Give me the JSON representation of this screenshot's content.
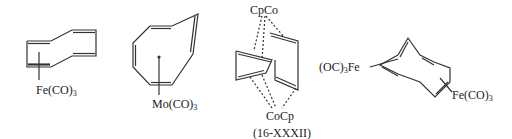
{
  "structures": [
    {
      "id": "s1",
      "description": "cyclooctatetraene diene-bound iron tricarbonyl",
      "metal_label": {
        "text": "Fe(CO)",
        "sub": "3"
      }
    },
    {
      "id": "s2",
      "description": "cyclooctatetraene triene-bound molybdenum tricarbonyl",
      "metal_label": {
        "text": "Mo(CO)",
        "sub": "3"
      }
    },
    {
      "id": "s3",
      "description": "bis(cobalt) tub COT complex",
      "top_label": "CpCo",
      "bottom_label": "CoCp",
      "caption": "(16-XXXII)"
    },
    {
      "id": "s4",
      "description": "bis(iron tricarbonyl) COT",
      "left_label": {
        "prefix": "(OC)",
        "sub": "3",
        "suffix": "Fe"
      },
      "right_label": {
        "text": "Fe(CO)",
        "sub": "3"
      }
    }
  ],
  "colors": {
    "stroke": "#333333",
    "background": "#ffffff"
  }
}
